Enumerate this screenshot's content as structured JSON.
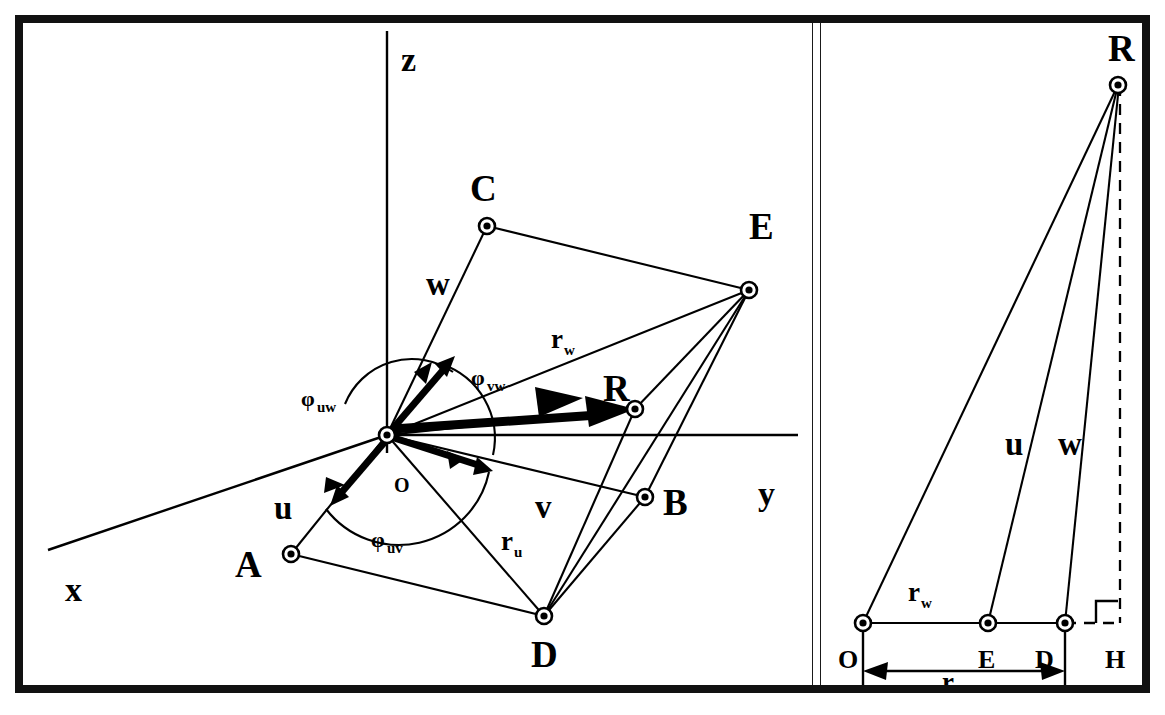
{
  "figure": {
    "frame_color": "#111111",
    "ink_color": "#000000",
    "background": "#ffffff"
  },
  "left_panel": {
    "name": "3d-vector-panel",
    "axes": [
      {
        "key": "x",
        "label": "x"
      },
      {
        "key": "y",
        "label": "y"
      },
      {
        "key": "z",
        "label": "z"
      }
    ],
    "origin_label": "O",
    "vectors": [
      {
        "key": "u",
        "label": "u"
      },
      {
        "key": "v",
        "label": "v"
      },
      {
        "key": "w",
        "label": "w"
      },
      {
        "key": "R",
        "label": "R"
      }
    ],
    "angles": [
      {
        "key": "phi_uw",
        "base": "φ",
        "sub": "uw"
      },
      {
        "key": "phi_vw",
        "base": "φ",
        "sub": "vw"
      },
      {
        "key": "phi_uv",
        "base": "φ",
        "sub": "uv"
      }
    ],
    "radii": [
      {
        "key": "r_w",
        "base": "r",
        "sub": "w"
      },
      {
        "key": "r_u",
        "base": "r",
        "sub": "u"
      }
    ],
    "points": [
      {
        "key": "A",
        "label": "A",
        "x": 282,
        "y": 545
      },
      {
        "key": "B",
        "label": "B",
        "x": 636,
        "y": 488
      },
      {
        "key": "C",
        "label": "C",
        "x": 478,
        "y": 217
      },
      {
        "key": "D",
        "label": "D",
        "x": 535,
        "y": 607
      },
      {
        "key": "E",
        "label": "E",
        "x": 740,
        "y": 281
      },
      {
        "key": "R",
        "label": "R",
        "x": 626,
        "y": 400
      },
      {
        "key": "O",
        "label": "O",
        "x": 378,
        "y": 425
      }
    ]
  },
  "right_panel": {
    "name": "planar-projection-panel",
    "points": [
      {
        "key": "O",
        "label": "O",
        "x": 855,
        "y": 625
      },
      {
        "key": "E",
        "label": "E",
        "x": 980,
        "y": 625
      },
      {
        "key": "D",
        "label": "D",
        "x": 1053,
        "y": 625
      },
      {
        "key": "H",
        "label": "H",
        "x": 1103,
        "y": 625
      },
      {
        "key": "R",
        "label": "R",
        "x": 1110,
        "y": 85
      }
    ],
    "segment_labels": [
      {
        "key": "u",
        "label": "u"
      },
      {
        "key": "w",
        "label": "w"
      }
    ],
    "radii": [
      {
        "key": "r_w",
        "base": "r",
        "sub": "w"
      },
      {
        "key": "r_u",
        "base": "r",
        "sub": "u"
      }
    ],
    "right_angle_marker": "right-angle-square"
  }
}
